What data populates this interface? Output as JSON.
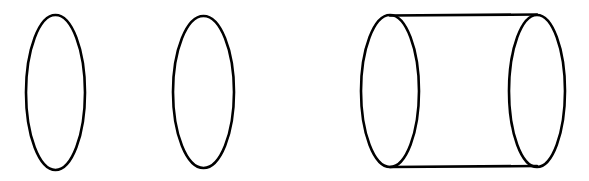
{
  "figure": {
    "background_color": "#ffffff",
    "stroke_color": "#000000",
    "stroke_width": 2.6,
    "fill_color": "#ffffff",
    "canvas": {
      "width": 589,
      "height": 181
    },
    "shapes": [
      {
        "name": "ellipse-left",
        "type": "ellipse",
        "cx": 55.5,
        "cy": 92.5,
        "rx": 29.5,
        "ry": 77.5
      },
      {
        "name": "ellipse-middle",
        "type": "ellipse",
        "cx": 203.5,
        "cy": 92.0,
        "rx": 30.5,
        "ry": 76.0
      },
      {
        "name": "cylinder",
        "type": "cylinder",
        "base_near": {
          "cx": 390.0,
          "cy": 91.0,
          "rx": 29.0,
          "ry": 76.0
        },
        "base_far": {
          "cx": 537.0,
          "cy": 91.0,
          "rx": 28.0,
          "ry": 76.0
        },
        "top_edge": {
          "x1": 390.0,
          "y1": 15.5,
          "x2": 537.0,
          "y2": 14.5
        },
        "bottom_edge": {
          "x1": 390.0,
          "y1": 167.0,
          "x2": 537.0,
          "y2": 166.0
        }
      }
    ]
  }
}
